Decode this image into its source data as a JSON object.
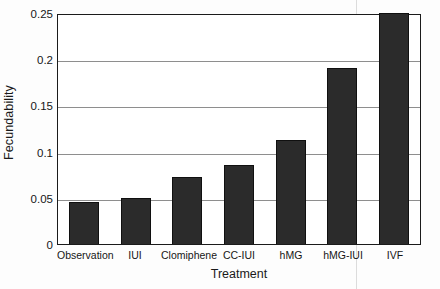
{
  "chart_data": {
    "type": "bar",
    "title": "",
    "xlabel": "Treatment",
    "ylabel": "Fecundability",
    "categories": [
      "Observation",
      "IUI",
      "Clomiphene",
      "CC-IUI",
      "hMG",
      "hMG-IUI",
      "IVF"
    ],
    "values": [
      0.045,
      0.05,
      0.072,
      0.085,
      0.113,
      0.19,
      0.25
    ],
    "ylim": [
      0,
      0.25
    ],
    "yticks": [
      0,
      0.05,
      0.1,
      0.15,
      0.2,
      0.25
    ],
    "ytick_labels": [
      "0",
      "0.05",
      "0.1",
      "0.15",
      "0.2",
      "0.25"
    ],
    "grid": "horizontal",
    "legend": "none",
    "bar_color": "#2b2b2b",
    "gridline_color": "#8e8e8e",
    "axis_color": "#1b1b1b",
    "background_color": "#ffffff"
  }
}
